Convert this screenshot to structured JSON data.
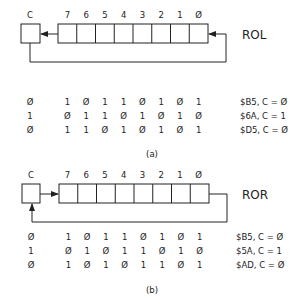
{
  "diagrams": [
    {
      "id": "a",
      "op": "ROL",
      "carry_label": "C",
      "bit_labels": [
        "7",
        "6",
        "5",
        "4",
        "3",
        "2",
        "1",
        "Ø"
      ],
      "rows": [
        {
          "carry": "Ø",
          "bits": [
            "1",
            "Ø",
            "1",
            "1",
            "Ø",
            "1",
            "Ø",
            "1"
          ],
          "result": "$B5, C = Ø"
        },
        {
          "carry": "1",
          "bits": [
            "Ø",
            "1",
            "1",
            "Ø",
            "1",
            "Ø",
            "1",
            "Ø"
          ],
          "result": "$6A, C = 1"
        },
        {
          "carry": "Ø",
          "bits": [
            "1",
            "1",
            "Ø",
            "1",
            "Ø",
            "1",
            "Ø",
            "1"
          ],
          "result": "$D5, C = Ø"
        }
      ],
      "caption": "(a)"
    },
    {
      "id": "b",
      "op": "ROR",
      "carry_label": "C",
      "bit_labels": [
        "7",
        "6",
        "5",
        "4",
        "3",
        "2",
        "1",
        "Ø"
      ],
      "rows": [
        {
          "carry": "Ø",
          "bits": [
            "1",
            "Ø",
            "1",
            "1",
            "Ø",
            "1",
            "Ø",
            "1"
          ],
          "result": "$B5, C = Ø"
        },
        {
          "carry": "1",
          "bits": [
            "Ø",
            "1",
            "Ø",
            "1",
            "1",
            "Ø",
            "1",
            "Ø"
          ],
          "result": "$5A, C = 1"
        },
        {
          "carry": "Ø",
          "bits": [
            "1",
            "Ø",
            "1",
            "Ø",
            "1",
            "1",
            "Ø",
            "1"
          ],
          "result": "$AD, C = Ø"
        }
      ],
      "caption": "(b)"
    }
  ]
}
